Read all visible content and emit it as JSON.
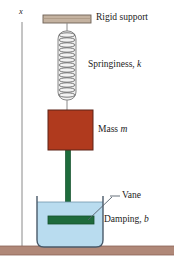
{
  "figure": {
    "width": 174,
    "height": 264,
    "background": "#ffffff"
  },
  "axis": {
    "label": "x",
    "x": 22,
    "top": 22,
    "bottom": 248,
    "color": "#8a8a8a"
  },
  "labels": {
    "rigid_support": "Rigid support",
    "springiness_text": "Springiness, ",
    "springiness_symbol": "k",
    "mass_text": "Mass ",
    "mass_symbol": "m",
    "vane": "Vane",
    "damping_text": "Damping, ",
    "damping_symbol": "b"
  },
  "parts": {
    "support_bar": {
      "name": "rigid-support-bar",
      "x": 43,
      "y": 15,
      "width": 48,
      "height": 8,
      "fill": "#c4b2a0",
      "stroke": "#6e6054"
    },
    "spring": {
      "name": "coil-spring",
      "cx": 67,
      "top": 30,
      "bottom": 100,
      "width": 18,
      "coils": 13,
      "stroke": "#6b6b6b",
      "fill": "#e8e8e8"
    },
    "upper_wire": {
      "name": "support-to-spring-wire",
      "x": 67,
      "y1": 23,
      "y2": 30,
      "stroke": "#8a8a8a"
    },
    "lower_wire": {
      "name": "spring-to-mass-wire",
      "x": 67,
      "y1": 100,
      "y2": 110,
      "stroke": "#8a8a8a"
    },
    "mass_block": {
      "name": "mass-block",
      "x": 48,
      "y": 110,
      "width": 45,
      "height": 40,
      "fill": "#b03a1e",
      "stroke": "#5c2316"
    },
    "rod": {
      "name": "connecting-rod",
      "x": 66,
      "y": 150,
      "width": 5,
      "height": 70,
      "fill": "#1e6b3c",
      "stroke": "#14512c"
    },
    "vane_plate": {
      "name": "vane-plate",
      "x": 48,
      "y": 216,
      "width": 46,
      "height": 8,
      "fill": "#1e6b3c",
      "stroke": "#14512c"
    },
    "container": {
      "name": "fluid-container",
      "x": 36,
      "y": 196,
      "width": 68,
      "height": 52,
      "stroke": "#4a5a6a"
    },
    "liquid": {
      "name": "damping-fluid",
      "fill": "#b9dcef",
      "surface_y": 202,
      "surface_stroke": "#6f94ab"
    },
    "ground": {
      "name": "ground-strip",
      "x": 0,
      "y": 246,
      "width": 174,
      "height": 9,
      "fill": "#b08878",
      "stroke": "#8c6355"
    },
    "leader_vane": {
      "name": "vane-leader-line",
      "x1": 108,
      "y1": 196,
      "x2": 119,
      "y2": 196,
      "stroke": "#55606b"
    },
    "leader_vane_diag": {
      "name": "vane-leader-diagonal",
      "x1": 114,
      "y1": 198,
      "x2": 88,
      "y2": 220,
      "stroke": "#55606b"
    }
  },
  "label_positions": {
    "rigid_support": {
      "left": 96,
      "top": 13
    },
    "springiness": {
      "left": 88,
      "top": 61
    },
    "mass": {
      "left": 98,
      "top": 125
    },
    "vane": {
      "left": 122,
      "top": 191
    },
    "damping": {
      "left": 104,
      "top": 215
    },
    "axis": {
      "left": 19,
      "top": 9
    }
  }
}
